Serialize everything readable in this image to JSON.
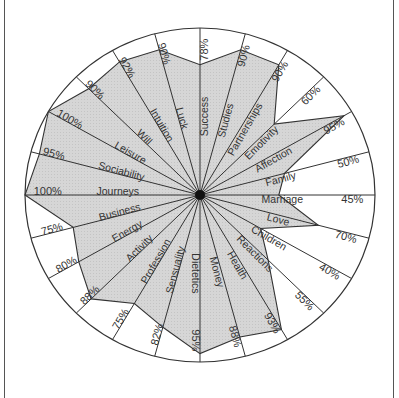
{
  "chart_data": {
    "type": "radar",
    "title": "",
    "xlabel": "",
    "ylabel": "",
    "ylim": [
      0,
      100
    ],
    "value_unit": "%",
    "start_angle_deg": 0,
    "direction": "clockwise",
    "grid": false,
    "legend": null,
    "categories": [
      "Success",
      "Studies",
      "Partnerships",
      "Emotivity",
      "Affection",
      "Family",
      "Marriage",
      "Love",
      "Children",
      "Reactions",
      "Health",
      "Money",
      "Dietetics",
      "Sensuality",
      "Profession",
      "Activity",
      "Energy",
      "Business",
      "Journeys",
      "Sociability",
      "Leisure",
      "Will",
      "Intuition",
      "Luck"
    ],
    "values": [
      78,
      90,
      90,
      60,
      95,
      50,
      45,
      70,
      40,
      55,
      93,
      88,
      95,
      82,
      75,
      88,
      80,
      75,
      100,
      95,
      100,
      90,
      92,
      90
    ],
    "value_labels": [
      "78%",
      "90%",
      "90%",
      "60%",
      "95%",
      "50%",
      "45%",
      "70%",
      "40%",
      "55%",
      "93%",
      "88%",
      "95%",
      "82%",
      "75%",
      "88%",
      "80%",
      "75%",
      "100%",
      "95%",
      "100%",
      "90%",
      "92%",
      "90%"
    ],
    "colors": {
      "fill": "#d4d4d4",
      "stroke": "#333333",
      "background": "#ffffff",
      "center_dot": "#111111"
    }
  }
}
